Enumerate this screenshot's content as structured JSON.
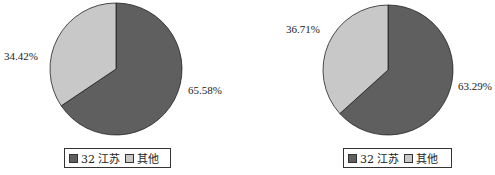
{
  "chart_data": [
    {
      "type": "pie",
      "title": "",
      "categories": [
        "32 江苏",
        "其他"
      ],
      "values": [
        65.58,
        34.42
      ],
      "labels": [
        "65.58%",
        "34.42%"
      ],
      "colors": [
        "#5f5f5f",
        "#c8c8c8"
      ],
      "legend_position": "bottom"
    },
    {
      "type": "pie",
      "title": "",
      "categories": [
        "32 江苏",
        "其他"
      ],
      "values": [
        63.29,
        36.71
      ],
      "labels": [
        "63.29%",
        "36.71%"
      ],
      "colors": [
        "#5f5f5f",
        "#c8c8c8"
      ],
      "legend_position": "bottom"
    }
  ],
  "left": {
    "label_main": "65.58%",
    "label_other": "34.42%",
    "legend": [
      "32 江苏",
      "其他"
    ]
  },
  "right": {
    "label_main": "63.29%",
    "label_other": "36.71%",
    "legend": [
      "32 江苏",
      "其他"
    ]
  }
}
